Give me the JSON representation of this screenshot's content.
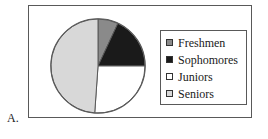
{
  "item_letter": "A.",
  "colors": {
    "freshmen": "#8a8a8a",
    "sophomores": "#1a1a1a",
    "juniors": "#ffffff",
    "seniors": "#d8d8d8",
    "outline": "#595959",
    "text": "#1a1a1a",
    "background": "#ffffff"
  },
  "legend": {
    "items": [
      {
        "label": "Freshmen",
        "swatch": "#8a8a8a"
      },
      {
        "label": "Sophomores",
        "swatch": "#1a1a1a"
      },
      {
        "label": "Juniors",
        "swatch": "#ffffff"
      },
      {
        "label": "Seniors",
        "swatch": "#d8d8d8"
      }
    ]
  },
  "chart_data": {
    "type": "pie",
    "title": "",
    "categories": [
      "Freshmen",
      "Sophomores",
      "Juniors",
      "Seniors"
    ],
    "values": [
      7,
      18,
      26,
      49
    ],
    "unit": "percent",
    "angles_deg": [
      25,
      65,
      94,
      176
    ],
    "start_angle_deg": 0,
    "direction": "clockwise",
    "colors": [
      "#8a8a8a",
      "#1a1a1a",
      "#ffffff",
      "#d8d8d8"
    ],
    "legend_position": "right",
    "data_labels": false,
    "grid": false
  }
}
